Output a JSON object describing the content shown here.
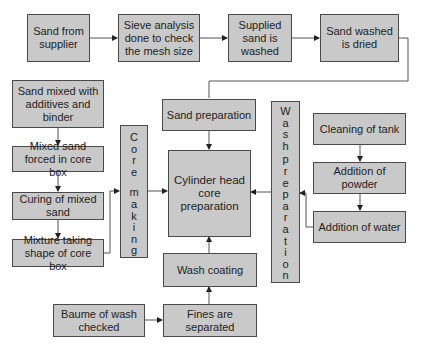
{
  "diagram": {
    "colors": {
      "box_fill": "#c9c9c9",
      "box_border": "#4a4a4a",
      "line": "#555555",
      "background": "#ffffff"
    },
    "top_row": [
      {
        "id": "sand_from_supplier",
        "label": "Sand from supplier"
      },
      {
        "id": "sieve_analysis",
        "label": "Sieve analysis done to check the mesh size"
      },
      {
        "id": "supplied_sand_washed",
        "label": "Supplied sand is washed"
      },
      {
        "id": "sand_washed_dried",
        "label": "Sand washed is dried"
      }
    ],
    "left_column": [
      {
        "id": "sand_mixed",
        "label": "Sand mixed with additives and binder"
      },
      {
        "id": "mixed_sand_forced",
        "label": "Mixed sand forced in core box"
      },
      {
        "id": "curing",
        "label": "Curing of mixed sand"
      },
      {
        "id": "mixture_shape",
        "label": "Mixture taking shape of core box"
      }
    ],
    "core_making": {
      "id": "core_making",
      "letters": [
        "C",
        "o",
        "r",
        "e",
        " ",
        "m",
        "a",
        "k",
        "i",
        "n",
        "g"
      ],
      "label": "Core making"
    },
    "wash_preparation": {
      "id": "wash_preparation",
      "letters": [
        "W",
        "a",
        "s",
        "h",
        " ",
        "p",
        "r",
        "e",
        "p",
        "a",
        "r",
        "a",
        "t",
        "i",
        "o",
        "n"
      ],
      "label": "Wash preparation"
    },
    "center": {
      "sand_preparation": "Sand preparation",
      "cylinder_head": "Cylinder head core preparation",
      "wash_coating": "Wash coating",
      "fines_separated": "Fines are separated",
      "baume_checked": "Baume of wash checked"
    },
    "right_column": [
      {
        "id": "cleaning_tank",
        "label": "Cleaning of tank"
      },
      {
        "id": "addition_powder",
        "label": "Addition of powder"
      },
      {
        "id": "addition_water",
        "label": "Addition of water"
      }
    ],
    "edges": [
      [
        "sand_from_supplier",
        "sieve_analysis"
      ],
      [
        "sieve_analysis",
        "supplied_sand_washed"
      ],
      [
        "supplied_sand_washed",
        "sand_washed_dried"
      ],
      [
        "sand_washed_dried",
        "sand_preparation"
      ],
      [
        "sand_mixed",
        "mixed_sand_forced"
      ],
      [
        "mixed_sand_forced",
        "curing"
      ],
      [
        "curing",
        "mixture_shape"
      ],
      [
        "mixture_shape",
        "core_making"
      ],
      [
        "core_making",
        "cylinder_head"
      ],
      [
        "sand_preparation",
        "cylinder_head"
      ],
      [
        "wash_preparation",
        "cylinder_head"
      ],
      [
        "wash_coating",
        "cylinder_head"
      ],
      [
        "fines_separated",
        "wash_coating"
      ],
      [
        "baume_checked",
        "fines_separated"
      ],
      [
        "cleaning_tank",
        "addition_powder"
      ],
      [
        "addition_powder",
        "addition_water"
      ],
      [
        "addition_water",
        "wash_preparation"
      ]
    ]
  }
}
